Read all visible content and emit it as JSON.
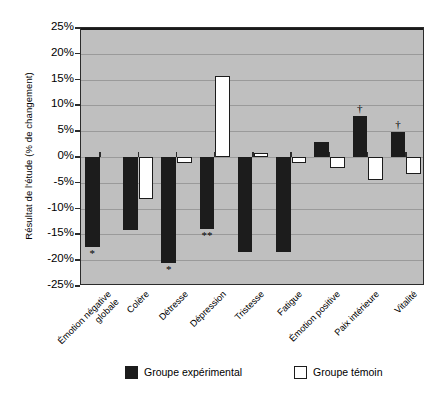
{
  "chart_data": {
    "type": "bar",
    "title": "",
    "xlabel": "",
    "ylabel": "Résultat de l'étude (% de changement)",
    "ylim": [
      -25,
      25
    ],
    "ytick_labels": [
      "25%",
      "20%",
      "15%",
      "10%",
      "5%",
      "0%",
      "-5%",
      "-10%",
      "-15%",
      "-20%",
      "-25%"
    ],
    "ytick_values": [
      25,
      20,
      15,
      10,
      5,
      0,
      -5,
      -10,
      -15,
      -20,
      -25
    ],
    "grid": true,
    "legend_position": "bottom",
    "categories": [
      "Émotion négative globale",
      "Colère",
      "Détresse",
      "Dépression",
      "Tristesse",
      "Fatigue",
      "Émotion positive",
      "Paix intérieure",
      "Vitalité"
    ],
    "category_lines": [
      [
        "Émotion négative",
        "globale"
      ],
      [
        "Colère"
      ],
      [
        "Détresse"
      ],
      [
        "Dépression"
      ],
      [
        "Tristesse"
      ],
      [
        "Fatigue"
      ],
      [
        "Émotion positive"
      ],
      [
        "Paix intérieure"
      ],
      [
        "Vitalité"
      ]
    ],
    "series": [
      {
        "name": "Groupe expérimental",
        "color": "#1c1c1c",
        "values": [
          -17.5,
          -14.2,
          -20.5,
          -13.9,
          -18.5,
          -18.4,
          2.9,
          7.9,
          4.8
        ],
        "annotations": [
          "*",
          "",
          "*",
          "**",
          "",
          "",
          "",
          "†",
          "†"
        ]
      },
      {
        "name": "Groupe témoin",
        "color": "#ffffff",
        "values": [
          0,
          -8.1,
          -1.1,
          15.7,
          0.8,
          -1.2,
          -2.2,
          -4.4,
          -3.2
        ],
        "annotations": [
          "",
          "",
          "",
          "",
          "",
          "",
          "",
          "",
          ""
        ]
      }
    ]
  },
  "legend": {
    "items": [
      {
        "label": "Groupe expérimental",
        "swatch": "filled-black-square"
      },
      {
        "label": "Groupe témoin",
        "swatch": "outlined-white-square"
      }
    ]
  }
}
